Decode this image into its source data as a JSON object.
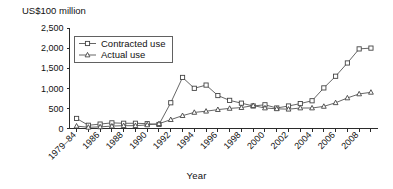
{
  "chart_data": {
    "type": "line",
    "title": "",
    "ylabel": "US$100 million",
    "xlabel": "Year",
    "ylim": [
      0,
      2500
    ],
    "y_ticks": [
      "0",
      "500",
      "1,000",
      "1,500",
      "2,000",
      "2,500"
    ],
    "grid": false,
    "legend_position": "top-left-inside",
    "categories": [
      "1979–84",
      "1985",
      "1986",
      "1987",
      "1988",
      "1989",
      "1990",
      "1991",
      "1992",
      "1993",
      "1994",
      "1995",
      "1996",
      "1997",
      "1998",
      "1999",
      "2000",
      "2001",
      "2002",
      "2003",
      "2004",
      "2005",
      "2006",
      "2007",
      "2008",
      "2009"
    ],
    "x_tick_labels": [
      "1979–84",
      "1986",
      "1988",
      "1990",
      "1992",
      "1994",
      "1996",
      "1998",
      "2000",
      "2002",
      "2004",
      "2006",
      "2008"
    ],
    "series": [
      {
        "name": "Contracted use",
        "marker": "square",
        "values": [
          250,
          80,
          110,
          140,
          130,
          130,
          120,
          100,
          640,
          1270,
          1000,
          1080,
          820,
          700,
          630,
          560,
          590,
          510,
          560,
          620,
          690,
          1010,
          1300,
          1630,
          1980,
          2000
        ]
      },
      {
        "name": "Actual use",
        "marker": "triangle",
        "values": [
          60,
          30,
          40,
          60,
          70,
          70,
          90,
          120,
          220,
          320,
          400,
          430,
          470,
          500,
          520,
          570,
          510,
          490,
          480,
          510,
          510,
          550,
          640,
          760,
          860,
          900
        ]
      }
    ]
  },
  "axes": {
    "y_title": "US$100 million",
    "x_title": "Year"
  },
  "legend": {
    "entries": [
      {
        "label": "Contracted use"
      },
      {
        "label": "Actual use"
      }
    ]
  }
}
